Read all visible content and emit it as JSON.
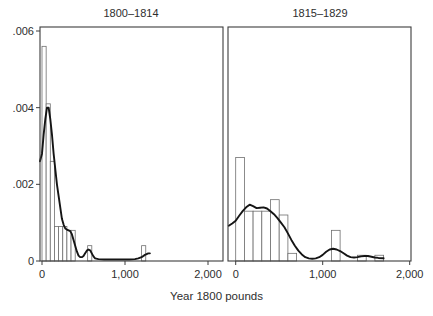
{
  "figure": {
    "xlabel": "Year 1800 pounds",
    "colors": {
      "background": "#ffffff",
      "panel_border": "#3d3d3d",
      "bar_outline": "#6f6f6f",
      "bar_fill": "#ffffff",
      "density_curve": "#151515",
      "text": "#2e2e2e"
    }
  },
  "chart_data": [
    {
      "type": "bar",
      "subtype": "histogram-with-density-overlay",
      "panel": "left",
      "title": "1800–1814",
      "bin_width": 50,
      "x_axis": {
        "range": [
          0,
          2000
        ],
        "ticks": [
          {
            "value": 0,
            "label": "0"
          },
          {
            "value": 1000,
            "label": "1,000"
          },
          {
            "value": 2000,
            "label": "2,000"
          }
        ]
      },
      "y_axis": {
        "range": [
          0,
          0.006
        ],
        "show_labels": true,
        "ticks": [
          {
            "value": 0,
            "label": "0"
          },
          {
            "value": 0.002,
            "label": ".002"
          },
          {
            "value": 0.004,
            "label": ".004"
          },
          {
            "value": 0.006,
            "label": ".006"
          }
        ]
      },
      "bars": [
        {
          "x0": 0,
          "x1": 50,
          "density": 0.0056
        },
        {
          "x0": 50,
          "x1": 100,
          "density": 0.0041
        },
        {
          "x0": 100,
          "x1": 150,
          "density": 0.0026
        },
        {
          "x0": 150,
          "x1": 200,
          "density": 0.0009
        },
        {
          "x0": 200,
          "x1": 250,
          "density": 0.0009
        },
        {
          "x0": 250,
          "x1": 300,
          "density": 0.0009
        },
        {
          "x0": 300,
          "x1": 350,
          "density": 0.0008
        },
        {
          "x0": 350,
          "x1": 400,
          "density": 0.0008
        },
        {
          "x0": 550,
          "x1": 600,
          "density": 0.0004
        },
        {
          "x0": 1200,
          "x1": 1250,
          "density": 0.0004
        }
      ],
      "density_curve": [
        [
          -25,
          0.0026
        ],
        [
          0,
          0.0028
        ],
        [
          20,
          0.0033
        ],
        [
          40,
          0.0037
        ],
        [
          60,
          0.004
        ],
        [
          80,
          0.004
        ],
        [
          100,
          0.0037
        ],
        [
          120,
          0.0033
        ],
        [
          140,
          0.0028
        ],
        [
          160,
          0.0024
        ],
        [
          180,
          0.002
        ],
        [
          200,
          0.0017
        ],
        [
          220,
          0.0014
        ],
        [
          240,
          0.0011
        ],
        [
          260,
          0.00095
        ],
        [
          280,
          0.00085
        ],
        [
          300,
          0.00082
        ],
        [
          320,
          0.0008
        ],
        [
          340,
          0.00078
        ],
        [
          360,
          0.0007
        ],
        [
          380,
          0.00055
        ],
        [
          400,
          0.0004
        ],
        [
          420,
          0.00025
        ],
        [
          440,
          0.00014
        ],
        [
          460,
          0.0001
        ],
        [
          480,
          0.0001
        ],
        [
          500,
          0.00013
        ],
        [
          520,
          0.0002
        ],
        [
          540,
          0.00027
        ],
        [
          560,
          0.0003
        ],
        [
          580,
          0.00028
        ],
        [
          600,
          0.0002
        ],
        [
          620,
          0.00012
        ],
        [
          640,
          7e-05
        ],
        [
          680,
          5e-05
        ],
        [
          750,
          4e-05
        ],
        [
          850,
          4e-05
        ],
        [
          950,
          4e-05
        ],
        [
          1050,
          4e-05
        ],
        [
          1120,
          5e-05
        ],
        [
          1160,
          7e-05
        ],
        [
          1200,
          0.0001
        ],
        [
          1240,
          0.00016
        ],
        [
          1280,
          0.0002
        ],
        [
          1300,
          0.0002
        ]
      ]
    },
    {
      "type": "bar",
      "subtype": "histogram-with-density-overlay",
      "panel": "right",
      "title": "1815–1829",
      "bin_width": 100,
      "x_axis": {
        "range": [
          0,
          2000
        ],
        "ticks": [
          {
            "value": 0,
            "label": "0"
          },
          {
            "value": 1000,
            "label": "1,000"
          },
          {
            "value": 2000,
            "label": "2,000"
          }
        ]
      },
      "y_axis": {
        "range": [
          0,
          0.006
        ],
        "show_labels": false,
        "ticks": []
      },
      "bars": [
        {
          "x0": 0,
          "x1": 100,
          "density": 0.0027
        },
        {
          "x0": 100,
          "x1": 200,
          "density": 0.0013
        },
        {
          "x0": 200,
          "x1": 300,
          "density": 0.0013
        },
        {
          "x0": 300,
          "x1": 400,
          "density": 0.0013
        },
        {
          "x0": 400,
          "x1": 500,
          "density": 0.0016
        },
        {
          "x0": 500,
          "x1": 600,
          "density": 0.0012
        },
        {
          "x0": 600,
          "x1": 700,
          "density": 0.0002
        },
        {
          "x0": 1100,
          "x1": 1200,
          "density": 0.0008
        },
        {
          "x0": 1400,
          "x1": 1500,
          "density": 0.00015
        },
        {
          "x0": 1600,
          "x1": 1700,
          "density": 0.00015
        }
      ],
      "density_curve": [
        [
          -80,
          0.00092
        ],
        [
          -40,
          0.00098
        ],
        [
          0,
          0.00105
        ],
        [
          40,
          0.00118
        ],
        [
          80,
          0.0013
        ],
        [
          120,
          0.0014
        ],
        [
          160,
          0.00147
        ],
        [
          200,
          0.00143
        ],
        [
          240,
          0.00138
        ],
        [
          280,
          0.00139
        ],
        [
          320,
          0.0014
        ],
        [
          360,
          0.00137
        ],
        [
          400,
          0.0013
        ],
        [
          440,
          0.00122
        ],
        [
          480,
          0.00112
        ],
        [
          520,
          0.001
        ],
        [
          560,
          0.00088
        ],
        [
          600,
          0.00072
        ],
        [
          640,
          0.00055
        ],
        [
          680,
          0.0004
        ],
        [
          720,
          0.00027
        ],
        [
          760,
          0.00017
        ],
        [
          800,
          0.0001
        ],
        [
          840,
          7e-05
        ],
        [
          880,
          6e-05
        ],
        [
          920,
          7e-05
        ],
        [
          960,
          0.0001
        ],
        [
          1000,
          0.00016
        ],
        [
          1040,
          0.00024
        ],
        [
          1080,
          0.0003
        ],
        [
          1120,
          0.00032
        ],
        [
          1160,
          0.0003
        ],
        [
          1200,
          0.00026
        ],
        [
          1240,
          0.0002
        ],
        [
          1280,
          0.00014
        ],
        [
          1320,
          0.0001
        ],
        [
          1360,
          9e-05
        ],
        [
          1400,
          0.0001
        ],
        [
          1440,
          0.00012
        ],
        [
          1480,
          0.00013
        ],
        [
          1520,
          0.00013
        ],
        [
          1560,
          0.00011
        ],
        [
          1600,
          9e-05
        ],
        [
          1640,
          8e-05
        ],
        [
          1700,
          7e-05
        ]
      ]
    }
  ]
}
